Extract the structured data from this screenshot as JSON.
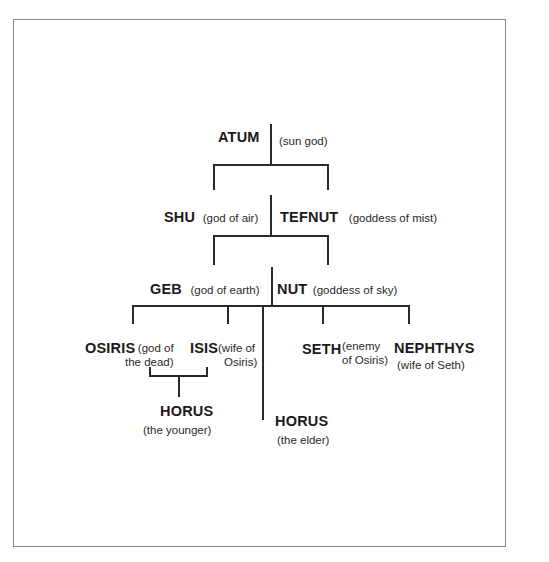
{
  "diagram": {
    "type": "family-tree",
    "title": "",
    "nodes": {
      "atum": {
        "name": "ATUM",
        "desc": "(sun god)"
      },
      "shu": {
        "name": "SHU",
        "desc": "(god of air)"
      },
      "tefnut": {
        "name": "TEFNUT",
        "desc": "(goddess of mist)"
      },
      "geb": {
        "name": "GEB",
        "desc": "(god of earth)"
      },
      "nut": {
        "name": "NUT",
        "desc": "(goddess of sky)"
      },
      "osiris": {
        "name": "OSIRIS",
        "desc_line1": "(god of",
        "desc_line2": "the dead)"
      },
      "isis": {
        "name": "ISIS",
        "desc_line1": "(wife of",
        "desc_line2": "Osiris)"
      },
      "seth": {
        "name": "SETH",
        "desc_line1": "(enemy",
        "desc_line2": "of Osiris)"
      },
      "nephthys": {
        "name": "NEPHTHYS",
        "desc": "(wife of Seth)"
      },
      "horus_younger": {
        "name": "HORUS",
        "desc": "(the younger)"
      },
      "horus_elder": {
        "name": "HORUS",
        "desc": "(the elder)"
      }
    },
    "edges": [
      [
        "atum",
        "shu"
      ],
      [
        "atum",
        "tefnut"
      ],
      [
        "shu+tefnut",
        "geb"
      ],
      [
        "shu+tefnut",
        "nut"
      ],
      [
        "geb+nut",
        "osiris"
      ],
      [
        "geb+nut",
        "isis"
      ],
      [
        "geb+nut",
        "horus_elder"
      ],
      [
        "geb+nut",
        "seth"
      ],
      [
        "geb+nut",
        "nephthys"
      ],
      [
        "osiris+isis",
        "horus_younger"
      ]
    ]
  }
}
